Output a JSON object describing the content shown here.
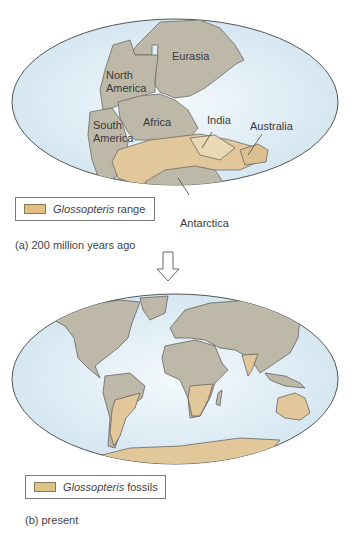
{
  "figure": {
    "colors": {
      "ocean": "#dfeef7",
      "ocean_edge": "#c7dfee",
      "land": "#bdb8a8",
      "land_outline": "#555555",
      "glossopteris": "#e2c79a",
      "legend_swatch_a": "#e0bf80",
      "legend_swatch_b": "#dcc386"
    },
    "panel_a": {
      "caption": "(a) 200 million years ago",
      "legend": {
        "italic": "Glossopteris",
        "label": "range"
      },
      "labels": {
        "eurasia": "Eurasia",
        "north_america_1": "North",
        "north_america_2": "America",
        "south_america_1": "South",
        "south_america_2": "America",
        "africa": "Africa",
        "india": "India",
        "australia": "Australia",
        "antarctica": "Antarctica"
      }
    },
    "arrow": {
      "direction": "down"
    },
    "panel_b": {
      "caption": "(b) present",
      "legend": {
        "italic": "Glossopteris",
        "label": "fossils"
      }
    }
  }
}
